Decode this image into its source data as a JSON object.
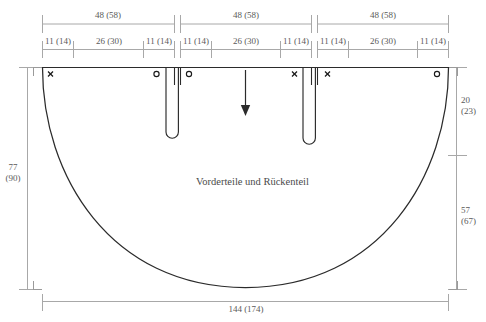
{
  "diagram": {
    "title": "Vorderteile und Rückenteil",
    "piece_label": "Vorderteile und Rückenteil",
    "unit_note": "",
    "colors": {
      "outline": "#2b2b2b",
      "dimension": "#9a9a9a",
      "text": "#5a5a5a",
      "background": "#ffffff"
    }
  },
  "dimensions": {
    "top_major": [
      {
        "label": "48 (58)",
        "value": 48,
        "alt": 58
      },
      {
        "label": "48 (58)",
        "value": 48,
        "alt": 58
      },
      {
        "label": "48 (58)",
        "value": 48,
        "alt": 58
      }
    ],
    "top_minor": [
      {
        "label": "11 (14)",
        "value": 11,
        "alt": 14
      },
      {
        "label": "26 (30)",
        "value": 26,
        "alt": 30
      },
      {
        "label": "11 (14)",
        "value": 11,
        "alt": 14
      },
      {
        "label": "11 (14)",
        "value": 11,
        "alt": 14
      },
      {
        "label": "26 (30)",
        "value": 26,
        "alt": 30
      },
      {
        "label": "11 (14)",
        "value": 11,
        "alt": 14
      },
      {
        "label": "11 (14)",
        "value": 11,
        "alt": 14
      },
      {
        "label": "26 (30)",
        "value": 26,
        "alt": 30
      },
      {
        "label": "11 (14)",
        "value": 11,
        "alt": 14
      }
    ],
    "left": {
      "label": "77\n(90)",
      "value": 77,
      "alt": 90
    },
    "right_upper": {
      "label": "20\n(23)",
      "value": 20,
      "alt": 23
    },
    "right_lower": {
      "label": "57\n(67)",
      "value": 57,
      "alt": 67
    },
    "bottom": {
      "label": "144 (174)",
      "value": 144,
      "alt": 174
    }
  },
  "markers": {
    "panel1": [
      {
        "symbol": "×",
        "name": "cross-marker"
      },
      {
        "symbol": "○",
        "name": "circle-marker"
      }
    ],
    "panel2": [
      {
        "symbol": "○",
        "name": "circle-marker"
      },
      {
        "symbol": "×",
        "name": "cross-marker"
      }
    ],
    "panel3": [
      {
        "symbol": "×",
        "name": "cross-marker"
      },
      {
        "symbol": "○",
        "name": "circle-marker"
      }
    ]
  },
  "grainline": {
    "direction": "down",
    "name": "grainline-arrow"
  }
}
